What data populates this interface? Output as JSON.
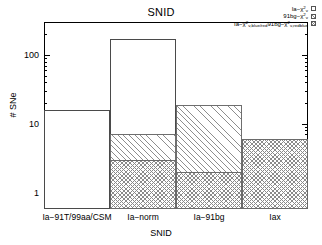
{
  "chart_data": {
    "type": "bar",
    "title": "SNID",
    "xlabel": "SNID",
    "ylabel": "# SNe",
    "yscale": "log",
    "ylim": [
      0.6,
      300
    ],
    "yticks": [
      1,
      10,
      100
    ],
    "ytick_labels": [
      "1",
      "10",
      "100"
    ],
    "grid": false,
    "legend_position": "top-right",
    "categories": [
      "Ia−91T/99aa/CSM",
      "Ia−norm",
      "Ia−91bg",
      "Iax"
    ],
    "series": [
      {
        "name": "Ia−χ²ᵥ",
        "style": "outline",
        "values": [
          16,
          170,
          6,
          6
        ]
      },
      {
        "name": "91bg−χ²ᵥ",
        "style": "diagonal-hatch",
        "values": [
          0,
          7,
          19,
          6
        ]
      },
      {
        "name": "Ia−χ²ᵥ,blue/red − 91bg−χ²ᵥ,redblue",
        "style": "cross-hatch",
        "values": [
          0,
          3,
          2,
          6
        ]
      }
    ]
  },
  "legend": {
    "entries": [
      {
        "main": "Ia−χ",
        "sup": "2",
        "sub": "ν",
        "tail": "",
        "swatch": "w"
      },
      {
        "main": "91bg−χ",
        "sup": "2",
        "sub": "ν",
        "tail": "",
        "swatch": "h"
      },
      {
        "main": "Ia−χ",
        "sup": "2",
        "sub": "ν,blue/red",
        "tail": "91bg−χ",
        "swatch": "c",
        "tail_sup": "2",
        "tail_sub": "ν,redblue"
      }
    ]
  }
}
